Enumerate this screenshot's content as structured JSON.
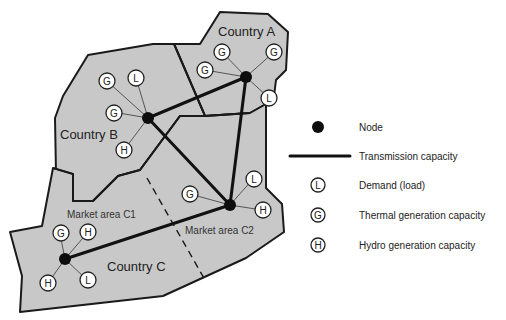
{
  "diagram": {
    "countries": [
      {
        "id": "A",
        "label": "Country A"
      },
      {
        "id": "B",
        "label": "Country B"
      },
      {
        "id": "C",
        "label": "Country C"
      }
    ],
    "market_areas": [
      {
        "id": "C1",
        "label": "Market area C1"
      },
      {
        "id": "C2",
        "label": "Market area C2"
      }
    ],
    "symbols": {
      "load": "L",
      "thermal": "G",
      "hydro": "H"
    },
    "nodes": [
      {
        "id": "A",
        "attached": [
          "G",
          "G",
          "G",
          "L"
        ]
      },
      {
        "id": "B",
        "attached": [
          "G",
          "L",
          "G",
          "H"
        ]
      },
      {
        "id": "C1",
        "attached": [
          "G",
          "H",
          "H",
          "L"
        ]
      },
      {
        "id": "C2",
        "attached": [
          "G",
          "L",
          "H"
        ]
      }
    ],
    "transmission_lines": [
      [
        "B",
        "A"
      ],
      [
        "B",
        "C2"
      ],
      [
        "A",
        "C2"
      ],
      [
        "C1",
        "C2"
      ]
    ]
  },
  "legend": {
    "items": [
      {
        "symbol": "node",
        "label": "Node"
      },
      {
        "symbol": "line",
        "label": "Transmission capacity"
      },
      {
        "symbol": "L",
        "label": "Demand (load)"
      },
      {
        "symbol": "G",
        "label": "Thermal generation capacity"
      },
      {
        "symbol": "H",
        "label": "Hydro generation capacity"
      }
    ]
  },
  "colors": {
    "region_fill": "#c8c8c8",
    "outline": "#1a1a1a",
    "node": "#0d0d0d",
    "background": "#ffffff"
  }
}
